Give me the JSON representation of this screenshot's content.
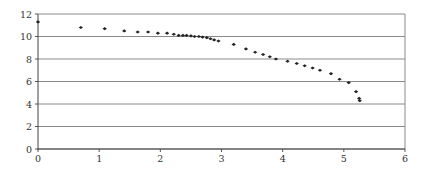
{
  "chart_data": {
    "type": "scatter",
    "title": "",
    "xlabel": "",
    "ylabel": "",
    "xlim": [
      0,
      6
    ],
    "ylim": [
      0,
      12
    ],
    "x_ticks": [
      "0",
      "1",
      "2",
      "3",
      "4",
      "5",
      "6"
    ],
    "y_ticks": [
      "0",
      "2",
      "4",
      "6",
      "8",
      "10",
      "12"
    ],
    "grid": "horizontal",
    "legend": "none",
    "marker_color": "#222222",
    "series": [
      {
        "name": "series1",
        "points": [
          [
            0.0,
            11.3
          ],
          [
            0.7,
            10.8
          ],
          [
            1.09,
            10.7
          ],
          [
            1.41,
            10.5
          ],
          [
            1.63,
            10.4
          ],
          [
            1.8,
            10.4
          ],
          [
            1.96,
            10.3
          ],
          [
            2.11,
            10.3
          ],
          [
            2.22,
            10.2
          ],
          [
            2.3,
            10.1
          ],
          [
            2.37,
            10.1
          ],
          [
            2.43,
            10.1
          ],
          [
            2.5,
            10.05
          ],
          [
            2.56,
            10.0
          ],
          [
            2.63,
            10.0
          ],
          [
            2.69,
            9.95
          ],
          [
            2.76,
            9.9
          ],
          [
            2.82,
            9.8
          ],
          [
            2.88,
            9.7
          ],
          [
            2.95,
            9.6
          ],
          [
            3.2,
            9.3
          ],
          [
            3.4,
            8.9
          ],
          [
            3.55,
            8.6
          ],
          [
            3.68,
            8.4
          ],
          [
            3.79,
            8.2
          ],
          [
            3.89,
            8.0
          ],
          [
            4.08,
            7.8
          ],
          [
            4.23,
            7.6
          ],
          [
            4.36,
            7.4
          ],
          [
            4.49,
            7.2
          ],
          [
            4.61,
            7.0
          ],
          [
            4.79,
            6.7
          ],
          [
            4.93,
            6.2
          ],
          [
            5.08,
            5.9
          ],
          [
            5.2,
            5.1
          ],
          [
            5.25,
            4.5
          ],
          [
            5.26,
            4.3
          ]
        ]
      }
    ]
  }
}
